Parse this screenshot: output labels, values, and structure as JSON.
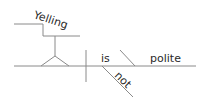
{
  "diagram": {
    "type": "sentence-diagram",
    "sentence": "Yelling is not polite",
    "words": {
      "subject": "Yelling",
      "verb": "is",
      "modifier": "not",
      "complement": "polite"
    },
    "line_color": "#8a8a8a",
    "text_color": "#2a2a2a"
  }
}
